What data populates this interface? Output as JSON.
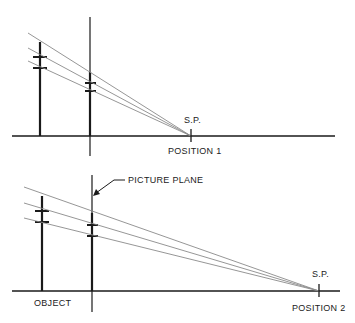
{
  "diagram": {
    "top": {
      "sp_label": "S.P.",
      "position_label": "POSITION 1"
    },
    "bottom": {
      "sp_label": "S.P.",
      "position_label": "POSITION 2",
      "object_label": "OBJECT",
      "picture_plane_label": "PICTURE PLANE"
    },
    "colors": {
      "line": "#1a1a1a",
      "ray": "#8a8a8a"
    }
  }
}
